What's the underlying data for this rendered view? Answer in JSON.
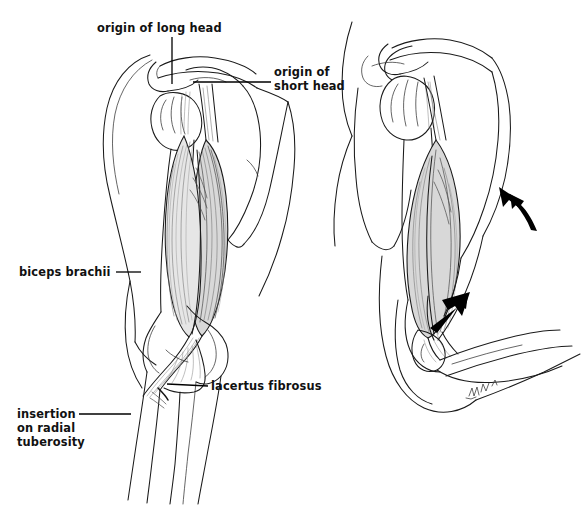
{
  "figure": {
    "background_color": "#ffffff",
    "ink_color": "#1a1a1a",
    "label_color": "#111111",
    "muscle_fill": "#d8d8d8",
    "arrow_color": "#000000",
    "width": 585,
    "height": 506
  },
  "labels": {
    "origin_long_head": "origin of long head",
    "origin_short_head_line1": "origin of",
    "origin_short_head_line2": "short head",
    "biceps_brachii": "biceps brachii",
    "lacertus_fibrosus": "lacertus fibrosus",
    "insertion_line1": "insertion",
    "insertion_line2": "on radial",
    "insertion_line3": "tuberosity",
    "signature": "mdh '96"
  },
  "panels": [
    {
      "name": "anterior-view",
      "description": "Left figure: anterior view of shoulder, arm extended, biceps brachii with long and short heads, elbow and forearm",
      "callouts": [
        "origin of long head",
        "origin of short head",
        "biceps brachii",
        "lacertus fibrosus",
        "insertion on radial tuberosity"
      ]
    },
    {
      "name": "flexed-view",
      "description": "Right figure: shoulder and flexed elbow showing contracted biceps brachii with motion arrows",
      "callouts": []
    }
  ],
  "annotations": {
    "arrow_forearm_motion": "curved-arrow-up-left",
    "arrow_insertion_pull": "solid-arrow-up-right"
  }
}
